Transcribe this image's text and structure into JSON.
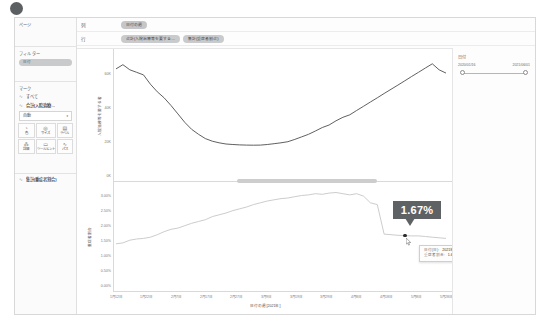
{
  "window": {
    "title": "Tableau Worksheet"
  },
  "sidebar": {
    "page_section": {
      "label": "ページ"
    },
    "filter_section": {
      "label": "フィルター",
      "chip": "日付"
    },
    "marks_section": {
      "label": "マーク",
      "rows": [
        {
          "icon": "line-icon",
          "label": "すべて"
        },
        {
          "icon": "line-icon",
          "label": "合計(入院治療…"
        }
      ],
      "mark_type": "自動",
      "buttons": [
        {
          "icon": "palette-icon",
          "label": "色"
        },
        {
          "icon": "size-icon",
          "label": "サイズ"
        },
        {
          "icon": "label-icon",
          "label": "ラベル"
        },
        {
          "icon": "detail-icon",
          "label": "詳細"
        },
        {
          "icon": "tooltip-icon",
          "label": "ツールヒント"
        },
        {
          "icon": "path-icon",
          "label": "パス"
        }
      ]
    },
    "measure_section": {
      "icon": "line-icon",
      "label": "集計(重症者割合)"
    }
  },
  "shelves": {
    "columns": {
      "label": "列",
      "chips": [
        {
          "text": "日付の週"
        }
      ]
    },
    "rows": {
      "label": "行",
      "chips": [
        {
          "text": "合計(入院治療等を要する…"
        },
        {
          "text": "集計(重症者割合)"
        }
      ]
    }
  },
  "filter_card": {
    "title": "日付",
    "range_start": "2020/01/16",
    "range_end": "2021/06/01"
  },
  "annotation": {
    "callout_value": "1.67%"
  },
  "tooltip": {
    "rows": [
      {
        "key": "日付(日):",
        "value": "2021年5月16日"
      },
      {
        "key": "重症者割合:",
        "value": "1.67%"
      }
    ]
  },
  "chart_data": [
    {
      "type": "line",
      "title": "",
      "ylabel": "入院治療等を要する者",
      "xlabel": "",
      "ylim": [
        0,
        70000
      ],
      "yticks": [
        "0K",
        "20K",
        "40K",
        "60K"
      ],
      "ytick_values": [
        0,
        20000,
        40000,
        60000
      ],
      "grid": false,
      "highlight_point": {
        "x_index": 67,
        "value": 66000
      },
      "x": [
        "2020/01/12",
        "2020/01/22",
        "2020/02/07",
        "2020/02/17",
        "2020/02/27",
        "2020/03/09",
        "2020/03/19",
        "2020/03/29",
        "2020/04/08",
        "2020/04/18",
        "2020/05/08",
        "2020/05/28"
      ],
      "values": [
        63000,
        65500,
        62500,
        61000,
        59500,
        54000,
        49500,
        46000,
        41500,
        36500,
        31500,
        27500,
        24500,
        22000,
        20500,
        19500,
        18800,
        18500,
        18300,
        18200,
        18100,
        18200,
        18500,
        19000,
        19500,
        20200,
        21500,
        23000,
        24500,
        26500,
        28500,
        30000,
        32500,
        34500,
        36000,
        38500,
        41000,
        43500,
        46000,
        48500,
        51000,
        53500,
        56000,
        58500,
        61000,
        63500,
        66000,
        62500,
        60500
      ]
    },
    {
      "type": "line",
      "title": "",
      "ylabel": "重症者割合",
      "xlabel": "日付の週 [2021年]",
      "ylim": [
        0,
        3.25
      ],
      "yticks": [
        "0.00%",
        "0.50%",
        "1.00%",
        "1.50%",
        "2.00%",
        "2.50%",
        "3.00%"
      ],
      "ytick_values": [
        0.0,
        0.5,
        1.0,
        1.5,
        2.0,
        2.5,
        3.0
      ],
      "grid": false,
      "highlight_point": {
        "x_label": "2021年5月16日",
        "value": 1.67
      },
      "xticks": [
        "1月12日",
        "1月22日",
        "2月7日",
        "2月17日",
        "2月27日",
        "3月9日",
        "3月19日",
        "3月29日",
        "4月8日",
        "4月18日",
        "5月8日",
        "5月28日"
      ],
      "values": [
        1.4,
        1.43,
        1.52,
        1.56,
        1.58,
        1.62,
        1.7,
        1.8,
        1.88,
        1.92,
        2.0,
        2.08,
        2.14,
        2.2,
        2.3,
        2.36,
        2.42,
        2.5,
        2.56,
        2.62,
        2.7,
        2.76,
        2.82,
        2.86,
        2.9,
        2.92,
        2.96,
        3.0,
        3.02,
        3.06,
        3.04,
        3.08,
        3.1,
        3.06,
        3.02,
        3.06,
        2.98,
        2.76,
        2.7,
        1.72,
        1.7,
        1.68,
        1.67,
        1.66,
        1.66,
        1.64,
        1.62,
        1.6,
        1.58
      ]
    }
  ]
}
